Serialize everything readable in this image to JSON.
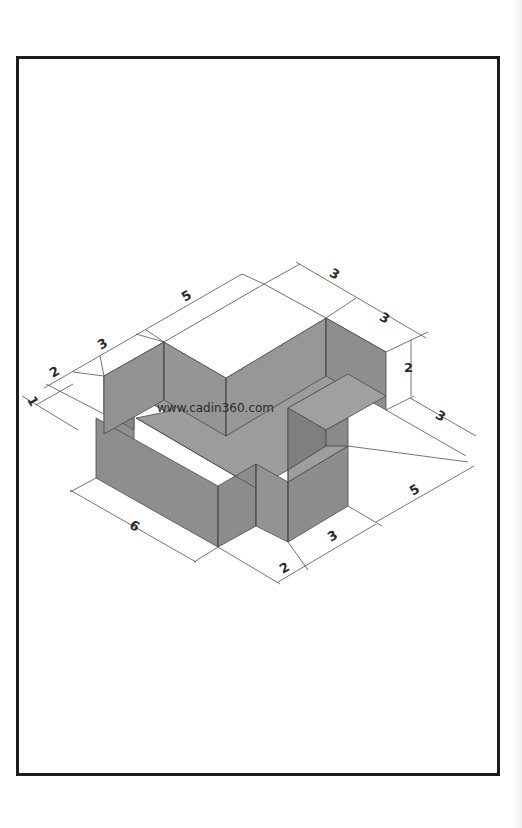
{
  "drawing": {
    "type": "isometric-dimensioned-solid",
    "watermark": "www.cadin360.com",
    "colors": {
      "frame": "#1c1c1c",
      "face_dark": "#8a8a8a",
      "face_mid": "#959595",
      "face_light": "#a3a3a3",
      "edge": "#4a4a4a",
      "dim_line": "#3a3a3a"
    }
  },
  "dimensions": {
    "left_1": "1",
    "left_2": "2",
    "top_3_left": "3",
    "top_5": "5",
    "top_3_right_a": "3",
    "top_3_right_b": "3",
    "right_height_2": "2",
    "right_3": "3",
    "right_5": "5",
    "bottom_3": "3",
    "bottom_2": "2",
    "bottom_6": "6"
  }
}
